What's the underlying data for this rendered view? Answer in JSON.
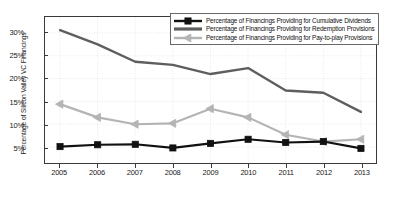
{
  "chart_data": {
    "type": "line",
    "title": "",
    "xlabel": "",
    "ylabel": "Percentage of Silicon Valley VC Financings",
    "categories": [
      "2005",
      "2006",
      "2007",
      "2008",
      "2009",
      "2010",
      "2011",
      "2012",
      "2013"
    ],
    "x": [
      2005,
      2006,
      2007,
      2008,
      2009,
      2010,
      2011,
      2012,
      2013
    ],
    "xlim": [
      2004.6,
      2013.4
    ],
    "ylim": [
      1.5,
      33.5
    ],
    "yticks": [
      5,
      10,
      15,
      20,
      25,
      30
    ],
    "ytick_labels": [
      "5%",
      "10%",
      "15%",
      "20%",
      "25%",
      "30%"
    ],
    "grid": true,
    "legend_position": "top-right",
    "series": [
      {
        "name": "Percentage of Financings Providing for Cumulative Dividends",
        "color": "#111111",
        "marker": "square",
        "values": [
          5.1,
          5.5,
          5.6,
          4.8,
          5.8,
          6.7,
          6.0,
          6.2,
          4.7
        ]
      },
      {
        "name": "Percentage of Financings Providing for Redemption Provisions",
        "color": "#5e5e5e",
        "marker": "none",
        "values": [
          30.6,
          27.5,
          23.7,
          23.0,
          21.0,
          22.3,
          17.4,
          16.9,
          12.7
        ]
      },
      {
        "name": "Percentage of Financings Providing for Pay-to-play Provisions",
        "color": "#b4b4b4",
        "marker": "triangle-left",
        "values": [
          14.4,
          11.5,
          10.0,
          10.2,
          13.4,
          11.5,
          7.7,
          6.2,
          6.7
        ]
      }
    ]
  },
  "axes": {
    "y_axis_label": "Percentage of Silicon Valley VC Financings",
    "y_tick_labels": [
      "30%",
      "25%",
      "20%",
      "15%",
      "10%",
      "5%"
    ],
    "x_tick_labels": [
      "2005",
      "2006",
      "2007",
      "2008",
      "2009",
      "2010",
      "2011",
      "2012",
      "2013"
    ]
  },
  "legend": {
    "items": [
      {
        "label": "Percentage of Financings Providing for Cumulative Dividends",
        "color": "#111111"
      },
      {
        "label": "Percentage of Financings Providing for Redemption Provisions",
        "color": "#5e5e5e"
      },
      {
        "label": "Percentage of Financings Providing for Pay-to-play Provisions",
        "color": "#b4b4b4"
      }
    ]
  }
}
